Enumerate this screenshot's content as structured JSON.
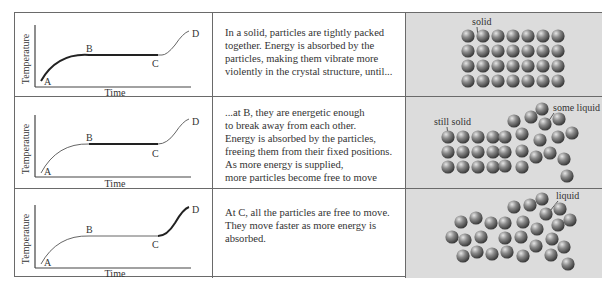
{
  "rows": [
    {
      "graph": {
        "y_axis_label": "Temperature",
        "x_axis_label": "Time",
        "points": [
          "A",
          "B",
          "C",
          "D"
        ],
        "highlight": "A-B"
      },
      "description": "In a solid, particles are tightly packed\ntogether. Energy is absorbed by the\nparticles, making them vibrate more\nviolently in the crystal structure, until...",
      "illustration": {
        "labels": [
          "solid"
        ]
      }
    },
    {
      "graph": {
        "y_axis_label": "Temperature",
        "x_axis_label": "Time",
        "points": [
          "A",
          "B",
          "C",
          "D"
        ],
        "highlight": "B-C"
      },
      "description": "...at B, they are energetic enough\nto break away from each other.\nEnergy is absorbed by the particles,\nfreeing them from their fixed positions.\nAs more energy is supplied,\nmore particles become free to move",
      "illustration": {
        "labels": [
          "still solid",
          "some liquid"
        ]
      }
    },
    {
      "graph": {
        "y_axis_label": "Temperature",
        "x_axis_label": "Time",
        "points": [
          "A",
          "B",
          "C",
          "D"
        ],
        "highlight": "C-D"
      },
      "description": "At C, all the particles are free to move.\nThey move faster as more energy is\nabsorbed.",
      "illustration": {
        "labels": [
          "liquid"
        ]
      }
    }
  ],
  "colors": {
    "border": "#6a6a6a",
    "panel_bg": "#dcdcdc",
    "curve": "#555555",
    "curve_highlight": "#222222",
    "particle": "#7a7a7a"
  }
}
